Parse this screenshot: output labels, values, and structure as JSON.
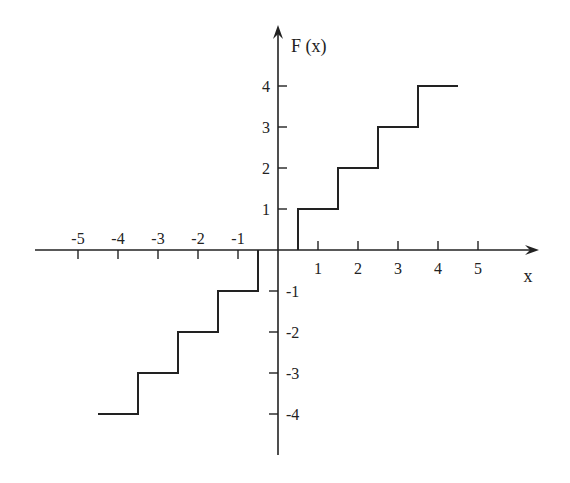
{
  "chart_data": {
    "type": "line",
    "subtype": "step",
    "title": "",
    "xlabel": "x",
    "ylabel": "F (x)",
    "xlim": [
      -5.5,
      6.5
    ],
    "ylim": [
      -5,
      5.5
    ],
    "grid": false,
    "legend": null,
    "x_ticks": [
      -5,
      -4,
      -3,
      -2,
      -1,
      1,
      2,
      3,
      4,
      5
    ],
    "x_tick_labels": [
      "-5",
      "-4",
      "-3",
      "-2",
      "-1",
      "1",
      "2",
      "3",
      "4",
      "5"
    ],
    "y_ticks": [
      4,
      3,
      2,
      1,
      -1,
      -2,
      -3,
      -4
    ],
    "y_tick_labels": [
      "4",
      "3",
      "2",
      "1",
      "-1",
      "-2",
      "-3",
      "-4"
    ],
    "series": [
      {
        "name": "F(x)",
        "segments": [
          {
            "x_start": -4.5,
            "x_end": -3.5,
            "y": -4
          },
          {
            "x_start": -3.5,
            "x_end": -2.5,
            "y": -3
          },
          {
            "x_start": -2.5,
            "x_end": -1.5,
            "y": -2
          },
          {
            "x_start": -1.5,
            "x_end": -0.5,
            "y": -1
          },
          {
            "x_start": -0.5,
            "x_end": 0.5,
            "y": 0
          },
          {
            "x_start": 0.5,
            "x_end": 1.5,
            "y": 1
          },
          {
            "x_start": 1.5,
            "x_end": 2.5,
            "y": 2
          },
          {
            "x_start": 2.5,
            "x_end": 3.5,
            "y": 3
          },
          {
            "x_start": 3.5,
            "x_end": 4.5,
            "y": 4
          }
        ],
        "points": [
          [
            -4.5,
            -4
          ],
          [
            -3.5,
            -4
          ],
          [
            -3.5,
            -3
          ],
          [
            -2.5,
            -3
          ],
          [
            -2.5,
            -2
          ],
          [
            -1.5,
            -2
          ],
          [
            -1.5,
            -1
          ],
          [
            -0.5,
            -1
          ],
          [
            -0.5,
            0
          ],
          [
            0.5,
            0
          ],
          [
            0.5,
            1
          ],
          [
            1.5,
            1
          ],
          [
            1.5,
            2
          ],
          [
            2.5,
            2
          ],
          [
            2.5,
            3
          ],
          [
            3.5,
            3
          ],
          [
            3.5,
            4
          ],
          [
            4.5,
            4
          ]
        ]
      }
    ]
  },
  "layout": {
    "origin_px": [
      278,
      250
    ],
    "unit_x_px": 40,
    "unit_y_px": 41,
    "x_axis_px": [
      35,
      539
    ],
    "y_axis_px": [
      25,
      455
    ],
    "line_color": "#222222"
  }
}
